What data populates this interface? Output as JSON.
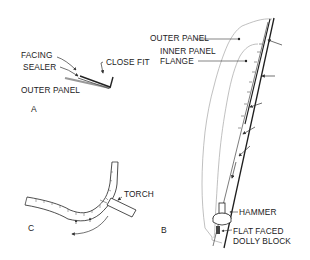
{
  "diagram": {
    "panel_a": {
      "figure_label": "A",
      "labels": {
        "facing": "FACING",
        "sealer": "SEALER",
        "close_fit": "CLOSE FIT",
        "outer_panel": "OUTER PANEL"
      }
    },
    "panel_b": {
      "figure_label": "B",
      "labels": {
        "outer_panel": "OUTER PANEL",
        "inner_panel_flange_line1": "INNER PANEL",
        "inner_panel_flange_line2": "FLANGE",
        "hammer": "HAMMER",
        "dolly_line1": "FLAT FACED",
        "dolly_line2": "DOLLY BLOCK"
      }
    },
    "panel_c": {
      "figure_label": "C",
      "labels": {
        "torch": "TORCH"
      }
    },
    "colors": {
      "ink": "#222222",
      "outline": "#9a9a9a",
      "background": "#ffffff"
    }
  }
}
